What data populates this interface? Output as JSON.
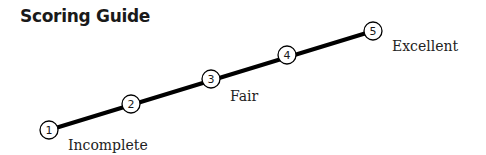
{
  "title": "Scoring Guide",
  "scale": {
    "line_color": "#000000",
    "nodes": [
      {
        "number": "1",
        "x": 49,
        "y": 130
      },
      {
        "number": "2",
        "x": 131,
        "y": 104
      },
      {
        "number": "3",
        "x": 211,
        "y": 79
      },
      {
        "number": "4",
        "x": 287,
        "y": 55
      },
      {
        "number": "5",
        "x": 373,
        "y": 31
      }
    ],
    "labels": [
      {
        "text": "Incomplete",
        "anchor_node": "1"
      },
      {
        "text": "Fair",
        "anchor_node": "3"
      },
      {
        "text": "Excellent",
        "anchor_node": "5"
      }
    ]
  }
}
